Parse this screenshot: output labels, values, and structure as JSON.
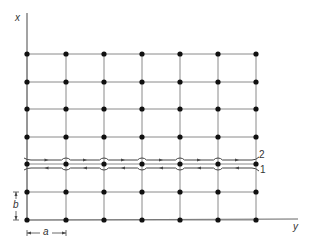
{
  "diagram": {
    "axes": {
      "vertical_label": "x",
      "horizontal_label": "y"
    },
    "lattice": {
      "columns": 7,
      "rows": 7,
      "col_x": [
        27,
        66,
        104,
        142,
        180,
        218,
        256
      ],
      "row_y": [
        54,
        82,
        109,
        137,
        164,
        192,
        220
      ],
      "line_color": "#8a8a8a",
      "node_color": "#111111"
    },
    "dimensions": {
      "horizontal_spacing_label": "a",
      "vertical_spacing_label": "b"
    },
    "contour": {
      "row_index": 4,
      "upper_line_label": "2",
      "lower_line_label": "1"
    }
  }
}
